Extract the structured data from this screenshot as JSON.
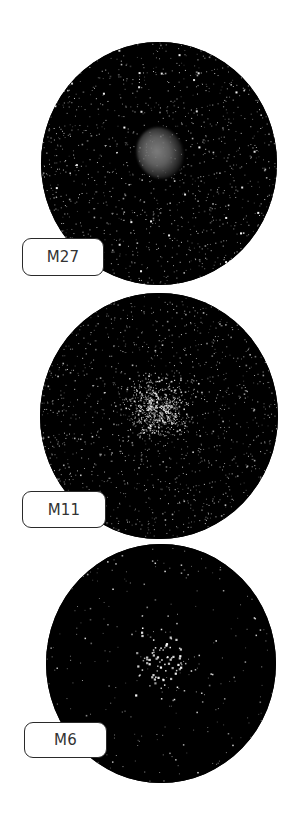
{
  "figure": {
    "panels": [
      {
        "id": "m27",
        "label": "M27",
        "object_type": "planetary-nebula",
        "colors": {
          "sky": "#000000",
          "nebula": "#6e6e6e",
          "stars": "#ffffff"
        }
      },
      {
        "id": "m11",
        "label": "M11",
        "object_type": "open-cluster-dense",
        "colors": {
          "sky": "#000000",
          "stars": "#ffffff"
        }
      },
      {
        "id": "m6",
        "label": "M6",
        "object_type": "open-cluster-sparse",
        "colors": {
          "sky": "#000000",
          "stars": "#ffffff"
        }
      }
    ],
    "label_style": {
      "background": "#ffffff",
      "border": "#2a2a2a",
      "text": "#333333"
    }
  }
}
